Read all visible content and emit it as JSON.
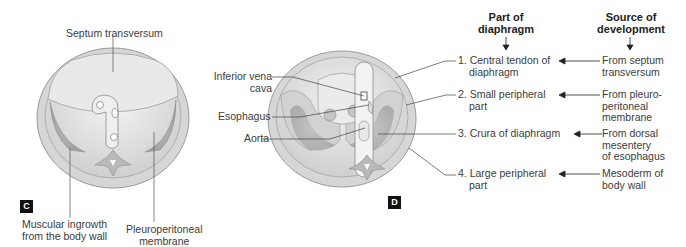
{
  "panel_c": {
    "tag": "C",
    "labels": {
      "septum": "Septum transversum",
      "muscular_1": "Muscular ingrowth",
      "muscular_2": "from the body wall",
      "pleuro_1": "Pleuroperitoneal",
      "pleuro_2": "membrane"
    }
  },
  "panel_d": {
    "tag": "D",
    "labels": {
      "ivc_1": "Inferior vena",
      "ivc_2": "cava",
      "esophagus": "Esophagus",
      "aorta": "Aorta"
    }
  },
  "table": {
    "headers": {
      "part_1": "Part of",
      "part_2": "diaphragm",
      "source_1": "Source of",
      "source_2": "development"
    },
    "rows": [
      {
        "part": [
          "1. Central tendon of",
          "diaphragm"
        ],
        "source": [
          "From septum",
          "transversum"
        ]
      },
      {
        "part": [
          "2. Small peripheral",
          "part"
        ],
        "source": [
          "From pleuro-",
          "peritoneal",
          "membrane"
        ]
      },
      {
        "part": [
          "3. Crura of diaphragm"
        ],
        "source": [
          "From dorsal",
          "mesentery",
          "of esophagus"
        ]
      },
      {
        "part": [
          "4. Large peripheral",
          "part"
        ],
        "source": [
          "Mesoderm of",
          "body wall"
        ]
      }
    ]
  }
}
